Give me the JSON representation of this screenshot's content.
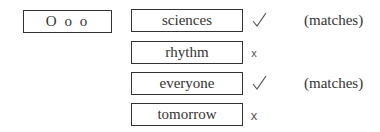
{
  "pattern": {
    "label": "O o o"
  },
  "rows": [
    {
      "word": "sciences",
      "result": "check",
      "note": "(matches)"
    },
    {
      "word": "rhythm",
      "result": "cross",
      "note": ""
    },
    {
      "word": "everyone",
      "result": "check",
      "note": "(matches)"
    },
    {
      "word": "tomorrow",
      "result": "cross",
      "note": ""
    }
  ],
  "symbols": {
    "cross": "x"
  }
}
